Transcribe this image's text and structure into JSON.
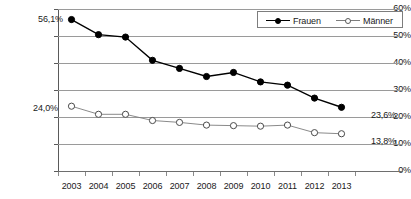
{
  "chart": {
    "type": "line",
    "background": "#ffffff",
    "legend_position": "top-right"
  },
  "legend": {
    "entries": [
      {
        "label": "Frauen",
        "marker": "filled-circle",
        "color": "#000000"
      },
      {
        "label": "Männer",
        "marker": "open-circle",
        "color": "#7d7d7d"
      }
    ]
  },
  "axes": {
    "y_ticks": [
      "0%",
      "10%",
      "20%",
      "30%",
      "40%",
      "50%",
      "60%"
    ],
    "x_ticks": [
      "2003",
      "2004",
      "2005",
      "2006",
      "2007",
      "2008",
      "2009",
      "2010",
      "2011",
      "2012",
      "2013"
    ]
  },
  "data_labels": {
    "frauen_start": "56,1%",
    "frauen_end": "23,6%",
    "maenner_start": "24,0%",
    "maenner_end": "13,8%"
  },
  "chart_data": {
    "type": "line",
    "title": "",
    "subtitle": "",
    "xlabel": "",
    "ylabel": "",
    "ylim": [
      0,
      60
    ],
    "ytick_values": [
      0,
      10,
      20,
      30,
      40,
      50,
      60
    ],
    "ytick_labels": [
      "0%",
      "10%",
      "20%",
      "30%",
      "40%",
      "50%",
      "60%"
    ],
    "grid": true,
    "grid_axis": "y",
    "legend": true,
    "legend_position": "top-right",
    "categories": [
      "2003",
      "2004",
      "2005",
      "2006",
      "2007",
      "2008",
      "2009",
      "2010",
      "2011",
      "2012",
      "2013"
    ],
    "series": [
      {
        "name": "Frauen",
        "color": "#000000",
        "marker": "filled-circle",
        "values": [
          56.1,
          50.5,
          49.6,
          41.0,
          38.0,
          35.0,
          36.5,
          33.0,
          31.8,
          27.0,
          23.6
        ]
      },
      {
        "name": "Männer",
        "color": "#7d7d7d",
        "marker": "open-circle",
        "values": [
          24.0,
          21.0,
          21.0,
          18.7,
          18.0,
          17.0,
          16.8,
          16.6,
          17.0,
          14.2,
          13.8
        ]
      }
    ],
    "annotations": [
      {
        "text": "56,1%",
        "series": "Frauen",
        "category": "2003",
        "value": 56.1
      },
      {
        "text": "23,6%",
        "series": "Frauen",
        "category": "2013",
        "value": 23.6
      },
      {
        "text": "24,0%",
        "series": "Männer",
        "category": "2003",
        "value": 24.0
      },
      {
        "text": "13,8%",
        "series": "Männer",
        "category": "2013",
        "value": 13.8
      }
    ]
  }
}
